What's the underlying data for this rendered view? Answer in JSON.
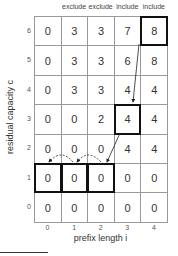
{
  "column_headers": [
    "",
    "exclude",
    "exclude",
    "include",
    "include"
  ],
  "row_labels": [
    "6",
    "5",
    "4",
    "3",
    "2",
    "1",
    "0"
  ],
  "column_labels": [
    "0",
    "1",
    "2",
    "3",
    "4"
  ],
  "y_axis_label": "residual capacity c",
  "x_axis_label": "prefix length i",
  "table": [
    [
      "0",
      "3",
      "3",
      "7",
      "8"
    ],
    [
      "0",
      "3",
      "3",
      "6",
      "8"
    ],
    [
      "0",
      "3",
      "3",
      "4",
      "4"
    ],
    [
      "0",
      "0",
      "2",
      "4",
      "4"
    ],
    [
      "0",
      "0",
      "0",
      "4",
      "4"
    ],
    [
      "0",
      "0",
      "0",
      "0",
      "0"
    ],
    [
      "0",
      "0",
      "0",
      "0",
      "0"
    ]
  ],
  "highlighted_cells": [
    [
      0,
      4
    ],
    [
      3,
      3
    ],
    [
      5,
      0
    ],
    [
      5,
      1
    ],
    [
      5,
      2
    ]
  ]
}
